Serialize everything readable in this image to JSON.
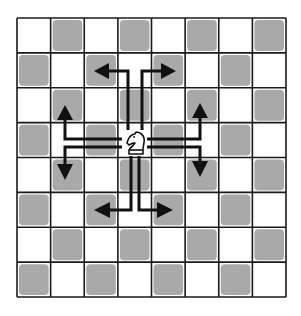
{
  "diagram": {
    "board": {
      "rows": 8,
      "cols": 8,
      "origin_x": 17,
      "origin_y": 18,
      "width": 269,
      "height": 279,
      "top_left_square": "light",
      "light_color": "#ffffff",
      "dark_color": "#a9a9a9",
      "line_color": "#1a1a1a"
    },
    "piece": {
      "type": "knight",
      "color": "white",
      "icon": "knight-icon",
      "square": {
        "row": 3,
        "col": 3
      }
    },
    "moves": [
      {
        "id": "up-left",
        "direction": "two up, one left",
        "target": {
          "row": 1,
          "col": 2
        }
      },
      {
        "id": "up-right",
        "direction": "two up, one right",
        "target": {
          "row": 1,
          "col": 4
        }
      },
      {
        "id": "left-up",
        "direction": "two left, one up",
        "target": {
          "row": 2,
          "col": 1
        }
      },
      {
        "id": "left-down",
        "direction": "two left, one down",
        "target": {
          "row": 4,
          "col": 1
        }
      },
      {
        "id": "right-up",
        "direction": "two right, one up",
        "target": {
          "row": 2,
          "col": 5
        }
      },
      {
        "id": "right-down",
        "direction": "two right, one down",
        "target": {
          "row": 4,
          "col": 5
        }
      },
      {
        "id": "down-left",
        "direction": "two down, one left",
        "target": {
          "row": 5,
          "col": 2
        }
      },
      {
        "id": "down-right",
        "direction": "two down, one right",
        "target": {
          "row": 5,
          "col": 4
        }
      }
    ],
    "arrow_color": "#111111"
  }
}
